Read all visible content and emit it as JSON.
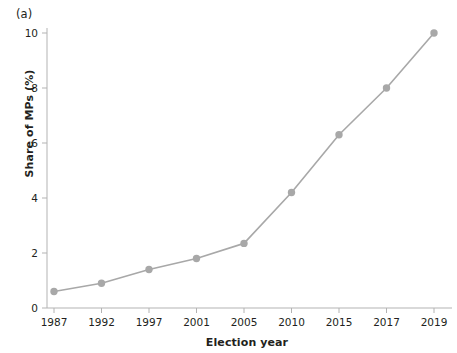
{
  "figure": {
    "panel_label": "(a)",
    "accent_color": "#a8a8a8",
    "axis_color": "#b3b3b3",
    "text_color": "#231f20"
  },
  "chart_data": {
    "type": "line",
    "title": "",
    "subtitle": "",
    "xlabel": "Election year",
    "ylabel": "Share of MPs (%)",
    "categories": [
      "1987",
      "1992",
      "1997",
      "2001",
      "2005",
      "2010",
      "2015",
      "2017",
      "2019"
    ],
    "values": [
      0.6,
      0.9,
      1.4,
      1.8,
      2.35,
      4.2,
      6.3,
      8.0,
      10.0
    ],
    "x_tick_labels": [
      "1987",
      "1992",
      "1997",
      "2001",
      "2005",
      "2010",
      "2015",
      "2017",
      "2019"
    ],
    "y_tick_labels": [
      "0",
      "2",
      "4",
      "6",
      "8",
      "10"
    ],
    "y_ticks": [
      0,
      2,
      4,
      6,
      8,
      10
    ],
    "ylim": [
      0,
      10.6
    ],
    "grid": false,
    "legend": "none",
    "marker": "circle",
    "series": [
      {
        "name": "Share of MPs (%)",
        "values": [
          0.6,
          0.9,
          1.4,
          1.8,
          2.35,
          4.2,
          6.3,
          8.0,
          10.0
        ],
        "color": "#a8a8a8"
      }
    ]
  }
}
